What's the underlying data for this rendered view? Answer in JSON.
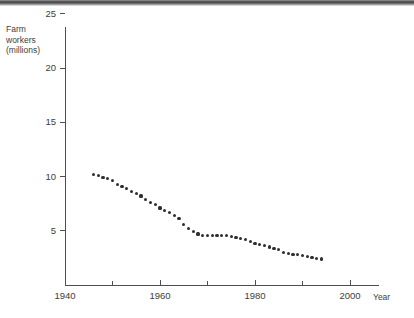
{
  "figure": {
    "scan_artifact": "top-gradient-bar"
  },
  "chart_data": {
    "type": "scatter",
    "title": "",
    "xlabel": "Year",
    "ylabel": "Farm workers (millions)",
    "ylabel_lines": [
      "Farm",
      "workers",
      "(millions)"
    ],
    "xlim": [
      1940,
      2002
    ],
    "ylim": [
      0,
      26
    ],
    "grid": false,
    "legend": null,
    "x_ticks": [
      1940,
      1950,
      1960,
      1970,
      1980,
      1990,
      2000
    ],
    "x_tick_labels": [
      "1940",
      "",
      "1960",
      "",
      "1980",
      "",
      "2000"
    ],
    "x_major_ticks": [
      1940,
      1960,
      1980,
      2000
    ],
    "x_minor_ticks": [
      1950,
      1970,
      1990
    ],
    "y_ticks": [
      5,
      10,
      15,
      20,
      25
    ],
    "y_tick_labels": [
      "5",
      "10",
      "15",
      "20",
      "25"
    ],
    "point_color": "#2e2e2e",
    "axis_color": "#4f4f4f",
    "x": [
      1946,
      1947,
      1948,
      1949,
      1950,
      1951,
      1952,
      1953,
      1954,
      1955,
      1956,
      1957,
      1958,
      1959,
      1960,
      1961,
      1962,
      1963,
      1964,
      1965,
      1966,
      1967,
      1968,
      1969,
      1970,
      1971,
      1972,
      1973,
      1974,
      1975,
      1976,
      1977,
      1978,
      1979,
      1980,
      1981,
      1982,
      1983,
      1984,
      1985,
      1986,
      1987,
      1988,
      1989,
      1990,
      1991,
      1992,
      1993,
      1994
    ],
    "values": [
      10.2,
      10.1,
      9.9,
      9.8,
      9.6,
      9.3,
      9.1,
      8.9,
      8.6,
      8.4,
      8.2,
      7.9,
      7.6,
      7.4,
      7.1,
      6.9,
      6.7,
      6.4,
      6.1,
      5.6,
      5.2,
      4.9,
      4.7,
      4.6,
      4.55,
      4.55,
      4.6,
      4.6,
      4.55,
      4.5,
      4.4,
      4.3,
      4.2,
      4.0,
      3.85,
      3.7,
      3.6,
      3.5,
      3.4,
      3.25,
      3.0,
      2.9,
      2.85,
      2.8,
      2.7,
      2.6,
      2.5,
      2.45,
      2.4
    ]
  }
}
